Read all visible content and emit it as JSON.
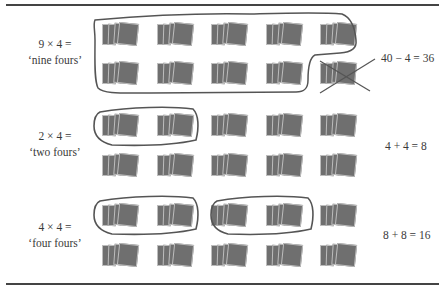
{
  "figure": {
    "sections": [
      {
        "id": "nine-fours",
        "expression": "9 × 4 =",
        "phrase": "‘nine fours’",
        "result_equation": "40 − 4 = 36",
        "grouping": "nine groups circled, tenth group crossed out"
      },
      {
        "id": "two-fours",
        "expression": "2 × 4 =",
        "phrase": "‘two fours’",
        "result_equation": "4 + 4 = 8",
        "grouping": "two groups circled"
      },
      {
        "id": "four-fours",
        "expression": "4 × 4 =",
        "phrase": "‘four fours’",
        "result_equation": "8 + 8 = 16",
        "grouping": "two pairs of groups circled"
      }
    ],
    "grid": {
      "columns": 5,
      "rows_per_section": 2,
      "cards_per_group": 4
    },
    "colors": {
      "card": "#6f6f6f",
      "outline": "#555555",
      "rule": "#444444",
      "text": "#3a3a3a"
    }
  }
}
